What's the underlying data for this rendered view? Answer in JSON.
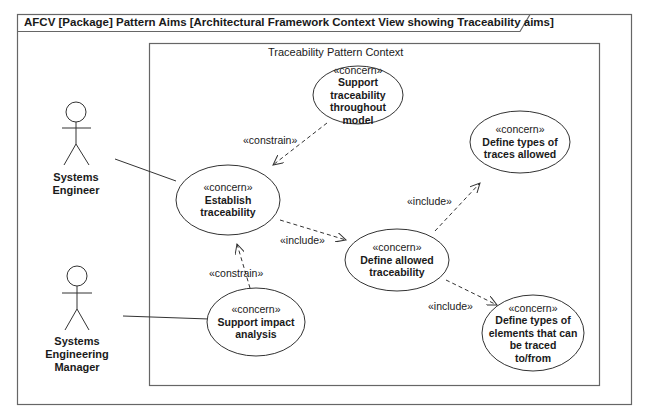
{
  "frame": {
    "title": "AFCV [Package] Pattern Aims [Architectural Framework Context View showing Traceability aims]"
  },
  "boundary": {
    "title": "Traceability Pattern Context"
  },
  "actors": [
    {
      "name": "Systems Engineer",
      "lines": [
        "Systems",
        "Engineer"
      ]
    },
    {
      "name": "Systems Engineering Manager",
      "lines": [
        "Systems",
        "Engineering",
        "Manager"
      ]
    }
  ],
  "use_cases": [
    {
      "stereotype": "«concern»",
      "lines": [
        "Support",
        "traceability",
        "throughout",
        "model"
      ]
    },
    {
      "stereotype": "«concern»",
      "lines": [
        "Establish",
        "traceability"
      ]
    },
    {
      "stereotype": "«concern»",
      "lines": [
        "Define types of",
        "traces allowed"
      ]
    },
    {
      "stereotype": "«concern»",
      "lines": [
        "Define allowed",
        "traceability"
      ]
    },
    {
      "stereotype": "«concern»",
      "lines": [
        "Support impact",
        "analysis"
      ]
    },
    {
      "stereotype": "«concern»",
      "lines": [
        "Define types of",
        "elements that can",
        "be traced",
        "to/from"
      ]
    }
  ],
  "relationships": [
    {
      "label": "«constrain»",
      "from": "Support traceability throughout model",
      "to": "Establish traceability"
    },
    {
      "label": "«include»",
      "from": "Establish traceability",
      "to": "Define allowed traceability"
    },
    {
      "label": "«include»",
      "from": "Define allowed traceability",
      "to": "Define types of traces allowed"
    },
    {
      "label": "«include»",
      "from": "Define allowed traceability",
      "to": "Define types of elements that can be traced to/from"
    },
    {
      "label": "«constrain»",
      "from": "Support impact analysis",
      "to": "Establish traceability"
    }
  ],
  "colors": {
    "line": "#333333",
    "frame": "#555555"
  }
}
